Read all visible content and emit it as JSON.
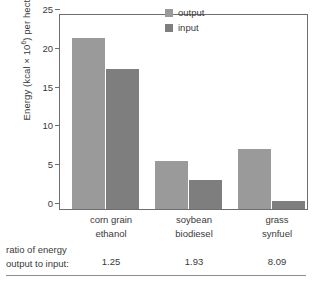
{
  "chart_data": {
    "type": "bar",
    "title": "",
    "xlabel": "",
    "ylabel": "Energy (kcal × 10⁶) per hectare",
    "ylabel_main": "Energy (kcal × 10",
    "ylabel_exp": "6",
    "ylabel_tail": ") per hectare",
    "categories": [
      "corn grain ethanol",
      "soybean biodiesel",
      "grass synfuel"
    ],
    "category_lines": [
      [
        "corn grain",
        "ethanol"
      ],
      [
        "soybean",
        "biodiesel"
      ],
      [
        "grass",
        "synfuel"
      ]
    ],
    "series": [
      {
        "name": "output",
        "values": [
          22.0,
          6.2,
          7.7
        ],
        "color": "#9a9a9a"
      },
      {
        "name": "input",
        "values": [
          18.0,
          3.7,
          1.0
        ],
        "color": "#7e7e7e"
      }
    ],
    "ylim": [
      0,
      25
    ],
    "yticks": [
      0,
      5,
      10,
      15,
      20,
      25
    ],
    "ytick_labels": [
      "0",
      "5",
      "10",
      "15",
      "20",
      "25"
    ],
    "grid": false,
    "legend_position": "top-right",
    "legend_entries": [
      "output",
      "input"
    ]
  },
  "footer": {
    "ratio_label_line1": "ratio of energy",
    "ratio_label_line2": "output to input:",
    "ratio_values": [
      "1.25",
      "1.93",
      "8.09"
    ]
  }
}
